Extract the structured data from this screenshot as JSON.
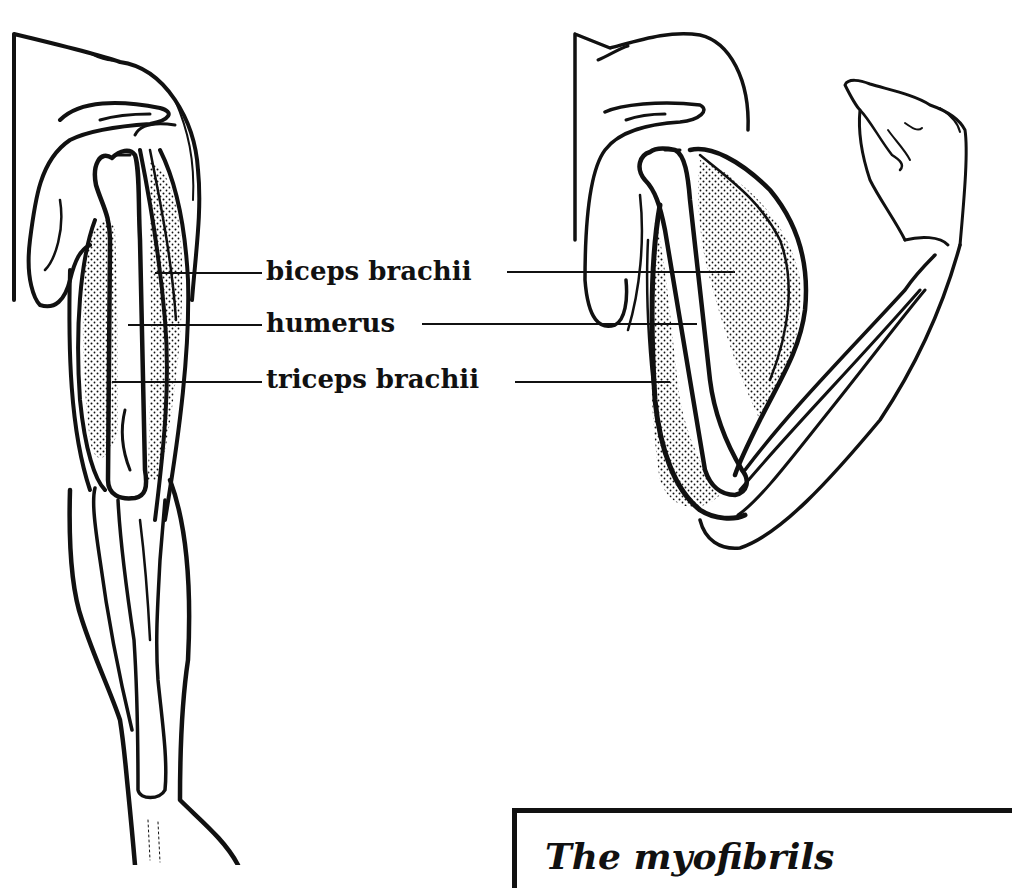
{
  "diagram": {
    "figures": [
      {
        "name": "extended-arm",
        "description": "Arm extended, anterior view showing muscles and humerus"
      },
      {
        "name": "flexed-arm",
        "description": "Arm flexed at elbow with contracted biceps"
      }
    ],
    "labels": [
      {
        "id": "biceps",
        "text": "biceps brachii"
      },
      {
        "id": "humerus",
        "text": "humerus"
      },
      {
        "id": "triceps",
        "text": "triceps brachii"
      }
    ],
    "info_box": {
      "title": "The myofibrils"
    },
    "colors": {
      "ink": "#111111",
      "background": "#ffffff"
    }
  }
}
